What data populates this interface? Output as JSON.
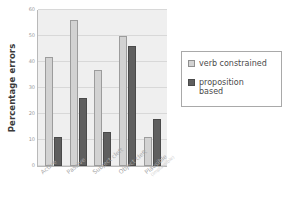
{
  "chart_data": {
    "type": "bar",
    "title": "",
    "xlabel": "",
    "ylabel": "Percentage errors",
    "ylim": [
      0,
      60
    ],
    "yticks": [
      0,
      10,
      20,
      30,
      40,
      50,
      60
    ],
    "ytick_labels": [
      "0",
      "10",
      "20",
      "30",
      "40",
      "50",
      "60"
    ],
    "grid": true,
    "legend_position": "right",
    "categories": [
      "Active",
      "Passive",
      "Subject cleft",
      "Object cleft",
      "Plausible"
    ],
    "category_sublabels": [
      "",
      "",
      "",
      "",
      "(implausible)"
    ],
    "series": [
      {
        "name": "verb constrained",
        "color": "#d2d2d2",
        "values": [
          42,
          56,
          37,
          50,
          11
        ]
      },
      {
        "name": "proposition based",
        "color": "#5f5f5f",
        "values": [
          11,
          26,
          13,
          46,
          18
        ]
      }
    ]
  },
  "legend": {
    "items": [
      {
        "label": "verb constrained",
        "swatch": "light-swatch-icon"
      },
      {
        "label": "proposition\nbased",
        "swatch": "dark-swatch-icon"
      }
    ]
  },
  "colors": {
    "plot_background": "#efefef",
    "gridline": "#d8d8d8",
    "axis": "#b9b9b9",
    "verb_constrained": "#d2d2d2",
    "proposition_based": "#5f5f5f",
    "tick_text": "#9a9a9a",
    "axis_title_text": "#3a3a3a",
    "legend_text": "#4a4a4a"
  }
}
